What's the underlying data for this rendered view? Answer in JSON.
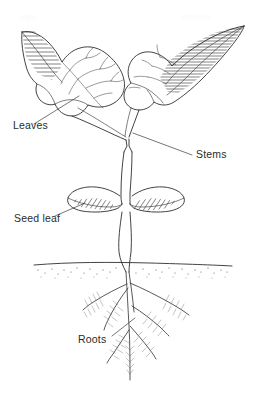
{
  "diagram": {
    "background_color": "#ffffff",
    "line_color": "#2e2e2e",
    "text_color": "#2b2b2b",
    "labels": [
      {
        "id": "leaves",
        "text": "Leaves",
        "x": 13,
        "y": 129
      },
      {
        "id": "stems",
        "text": "Stems",
        "x": 196,
        "y": 158
      },
      {
        "id": "seed-leaf",
        "text": "Seed leaf",
        "x": 14,
        "y": 222
      },
      {
        "id": "roots",
        "text": "Roots",
        "x": 78,
        "y": 343
      }
    ],
    "watermarks": [
      {
        "id": "watermark-left",
        "text": "eps",
        "x": 20,
        "y": 20
      },
      {
        "id": "watermark-right",
        "text": "vector",
        "x": 182,
        "y": 20
      }
    ],
    "parts": {
      "left_leaf": "left true leaf",
      "right_leaf": "right true leaf",
      "main_stem": "main stem",
      "seed_leaves": "cotyledons",
      "soil_line": "soil surface",
      "root_system": "root system"
    }
  }
}
